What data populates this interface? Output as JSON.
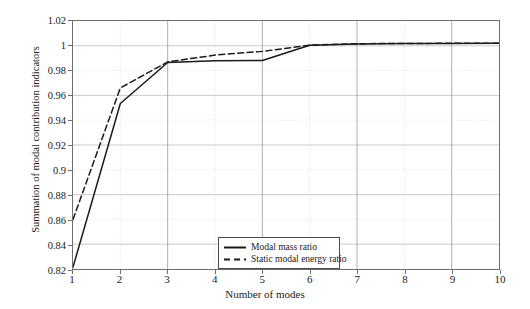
{
  "chart_data": {
    "type": "line",
    "title": "",
    "xlabel": "Number of modes",
    "ylabel": "Summation of modal contribution indicators",
    "x": [
      1,
      2,
      3,
      4,
      5,
      6,
      7,
      8,
      9,
      10
    ],
    "xlim": [
      1,
      10
    ],
    "ylim": [
      0.82,
      1.02
    ],
    "xticks": [
      "1",
      "2",
      "3",
      "4",
      "5",
      "6",
      "7",
      "8",
      "9",
      "10"
    ],
    "yticks": [
      "0.82",
      "0.84",
      "0.86",
      "0.88",
      "0.9",
      "0.92",
      "0.94",
      "0.96",
      "0.98",
      "1",
      "1.02"
    ],
    "ytick_values": [
      0.82,
      0.84,
      0.86,
      0.88,
      0.9,
      0.92,
      0.94,
      0.96,
      0.98,
      1.0,
      1.02
    ],
    "grid": true,
    "legend_position": "bottom-center",
    "series": [
      {
        "name": "Modal mass ratio",
        "style": "solid",
        "color": "#1a1a1a",
        "values": [
          0.8215,
          0.9535,
          0.9865,
          0.988,
          0.9882,
          1.0005,
          1.0015,
          1.0018,
          1.0019,
          1.002
        ]
      },
      {
        "name": "Static modal energy ratio",
        "style": "dashed",
        "color": "#1a1a1a",
        "values": [
          0.86,
          0.966,
          0.987,
          0.9925,
          0.9955,
          1.0005,
          1.0017,
          1.0019,
          1.002,
          1.0021
        ]
      }
    ]
  },
  "legend": {
    "items": [
      {
        "label": "Modal mass ratio",
        "style": "solid"
      },
      {
        "label": "Static modal energy ratio",
        "style": "dashed"
      }
    ]
  }
}
